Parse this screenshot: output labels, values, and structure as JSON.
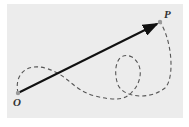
{
  "diagram": {
    "background_color": "#ececec",
    "vector_color": "#111111",
    "path_color": "#555555",
    "point_color": "#999999",
    "labels": {
      "origin": "O",
      "endpoint": "P"
    },
    "elements": [
      {
        "type": "point",
        "name": "O",
        "x": 18,
        "y": 93
      },
      {
        "type": "point",
        "name": "P",
        "x": 160,
        "y": 22
      },
      {
        "type": "arrow",
        "from": "O",
        "to": "P",
        "style": "solid",
        "meaning": "displacement vector"
      },
      {
        "type": "path",
        "from": "O",
        "to": "P",
        "style": "dashed",
        "meaning": "actual curved path with a loop"
      }
    ]
  }
}
